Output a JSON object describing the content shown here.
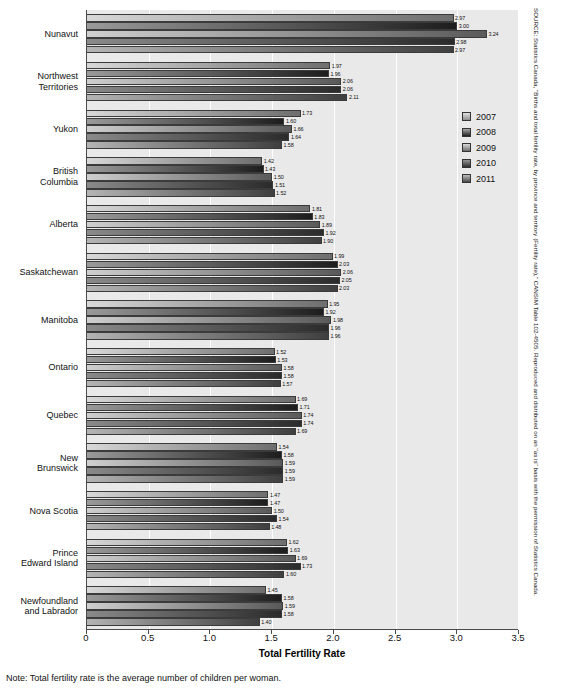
{
  "chart_data": {
    "type": "bar",
    "orientation": "horizontal",
    "title": "",
    "xlabel": "Total Fertility Rate",
    "ylabel": "",
    "xlim": [
      0,
      3.5
    ],
    "xticks": [
      "0",
      "0.5",
      "1.0",
      "1.5",
      "2.0",
      "2.5",
      "3.0",
      "3.5"
    ],
    "xtick_values": [
      0,
      0.5,
      1.0,
      1.5,
      2.0,
      2.5,
      3.0,
      3.5
    ],
    "grid": true,
    "legend_position": "right",
    "categories": [
      "Nunavut",
      "Northwest Territories",
      "Yukon",
      "British Columbia",
      "Alberta",
      "Saskatchewan",
      "Manitoba",
      "Ontario",
      "Quebec",
      "New Brunswick",
      "Nova Scotia",
      "Prince Edward Island",
      "Newfoundland and Labrador"
    ],
    "category_lines": [
      [
        "Nunavut"
      ],
      [
        "Northwest",
        "Territories"
      ],
      [
        "Yukon"
      ],
      [
        "British",
        "Columbia"
      ],
      [
        "Alberta"
      ],
      [
        "Saskatchewan"
      ],
      [
        "Manitoba"
      ],
      [
        "Ontario"
      ],
      [
        "Quebec"
      ],
      [
        "New",
        "Brunswick"
      ],
      [
        "Nova Scotia"
      ],
      [
        "Prince",
        "Edward Island"
      ],
      [
        "Newfoundland",
        "and Labrador"
      ]
    ],
    "series": [
      {
        "name": "2007",
        "values": [
          2.97,
          1.97,
          1.73,
          1.42,
          1.81,
          1.99,
          1.95,
          1.52,
          1.69,
          1.54,
          1.47,
          1.62,
          1.45
        ]
      },
      {
        "name": "2008",
        "values": [
          3.0,
          1.96,
          1.6,
          1.43,
          1.83,
          2.03,
          1.92,
          1.53,
          1.71,
          1.58,
          1.47,
          1.63,
          1.58
        ]
      },
      {
        "name": "2009",
        "values": [
          3.24,
          2.06,
          1.66,
          1.5,
          1.89,
          2.06,
          1.98,
          1.58,
          1.74,
          1.59,
          1.5,
          1.69,
          1.59
        ]
      },
      {
        "name": "2010",
        "values": [
          2.98,
          2.06,
          1.64,
          1.51,
          1.92,
          2.05,
          1.96,
          1.58,
          1.74,
          1.59,
          1.54,
          1.73,
          1.58
        ]
      },
      {
        "name": "2011",
        "values": [
          2.97,
          2.11,
          1.58,
          1.52,
          1.9,
          2.03,
          1.96,
          1.57,
          1.69,
          1.59,
          1.48,
          1.6,
          1.4
        ]
      }
    ]
  },
  "legend": {
    "items": [
      "2007",
      "2008",
      "2009",
      "2010",
      "2011"
    ]
  },
  "axis": {
    "title": "Total Fertility Rate"
  },
  "note": {
    "text": "Note: Total fertility rate is the average number of children per woman."
  },
  "source": {
    "text": "SOURCE: Statistics Canada, \"Births and total fertility rate, by province and territory (Fertility rate),\" CANSIM Table 102-4505. Reproduced and distributed on an \"as is\" basis with the permission of Statistics Canada."
  }
}
